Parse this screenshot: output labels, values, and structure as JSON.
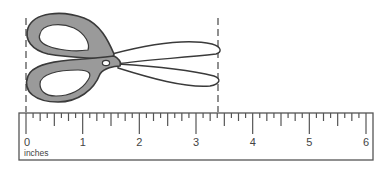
{
  "figure": {
    "object": "scissors",
    "unit_label": "inches",
    "ruler": {
      "min": 0,
      "max": 6,
      "major_labels": [
        "0",
        "1",
        "2",
        "3",
        "4",
        "5",
        "6"
      ],
      "subdivisions_per_inch": 4
    },
    "measurement_guides": {
      "left_inches": 0,
      "right_inches": 3.4
    },
    "colors": {
      "handle_fill": "#9a9a9a",
      "outline": "#3a3a3a",
      "ruler_line": "#555555",
      "background": "#ffffff"
    }
  }
}
